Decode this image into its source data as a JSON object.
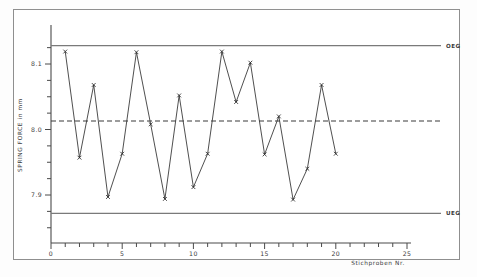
{
  "chart_data": {
    "type": "line",
    "title": "",
    "xlabel": "Stichproben Nr.",
    "ylabel": "SPRING FORCE in mm",
    "x": [
      1,
      2,
      3,
      4,
      5,
      6,
      7,
      8,
      9,
      10,
      11,
      12,
      13,
      14,
      15,
      16,
      17,
      18,
      19,
      20
    ],
    "values": [
      8.119,
      7.957,
      8.068,
      7.897,
      7.963,
      8.118,
      8.008,
      7.894,
      8.052,
      7.912,
      7.963,
      8.119,
      8.042,
      8.102,
      7.962,
      8.02,
      7.893,
      7.94,
      8.068,
      7.963
    ],
    "series": [
      {
        "name": "SPRING FORCE",
        "values": [
          8.119,
          7.957,
          8.068,
          7.897,
          7.963,
          8.118,
          8.008,
          7.894,
          8.052,
          7.912,
          7.963,
          8.119,
          8.042,
          8.102,
          7.962,
          8.02,
          7.893,
          7.94,
          8.068,
          7.963
        ]
      }
    ],
    "xlim": [
      0,
      25
    ],
    "ylim": [
      7.845,
      8.148
    ],
    "xticks": [
      0,
      5,
      10,
      15,
      20,
      25
    ],
    "xtick_labels": [
      "0",
      "5",
      "10",
      "15",
      "20",
      "25"
    ],
    "yticks": [
      7.9,
      8.0,
      8.1
    ],
    "ytick_labels": [
      "7.9",
      "8.0",
      "8.1"
    ],
    "grid": false,
    "legend_position": "right-inline",
    "reference_lines": [
      {
        "name": "OEG",
        "label": "OEG",
        "value": 8.128,
        "style": "solid"
      },
      {
        "name": "center",
        "label": "",
        "value": 8.013,
        "style": "dashed"
      },
      {
        "name": "UEG",
        "label": "UEG",
        "value": 7.872,
        "style": "solid"
      }
    ],
    "marker": "x",
    "line_color": "#3b3b3b"
  },
  "labels": {
    "upper_limit": "OEG",
    "lower_limit": "UEG",
    "y_axis_title": "SPRING FORCE in mm",
    "x_axis_title": "Stichproben Nr."
  },
  "colors": {
    "line": "#3b3b3b",
    "limit": "#7a7a7a",
    "axis": "#4a4a4a",
    "frame": "#8f8f8f",
    "background": "#ffffff"
  }
}
